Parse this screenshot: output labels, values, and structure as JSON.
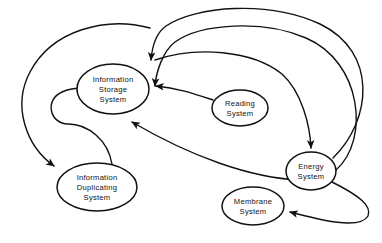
{
  "diagram": {
    "background_color": "#ffffff",
    "stroke_color": "#111111",
    "width": 382,
    "height": 243,
    "nodes": [
      {
        "id": "information-storage-system",
        "label_lines": [
          "Information",
          "Storage",
          "System"
        ],
        "line1": "Information",
        "line2": "Storage",
        "line3": "System",
        "cx": 113,
        "cy": 89,
        "rx": 36,
        "ry": 25
      },
      {
        "id": "reading-system",
        "label_lines": [
          "Reading",
          "System"
        ],
        "line1": "Reading",
        "line2": "System",
        "cx": 240,
        "cy": 108,
        "rx": 28,
        "ry": 18
      },
      {
        "id": "energy-system",
        "label_lines": [
          "Energy",
          "System"
        ],
        "line1": "Energy",
        "line2": "System",
        "cx": 311,
        "cy": 171,
        "rx": 25,
        "ry": 19
      },
      {
        "id": "membrane-system",
        "label_lines": [
          "Membrane",
          "System"
        ],
        "line1": "Membrane",
        "line2": "System",
        "cx": 253,
        "cy": 206,
        "rx": 31,
        "ry": 19
      },
      {
        "id": "information-duplicating-system",
        "label_lines": [
          "Information",
          "Duplicating",
          "System"
        ],
        "line1": "Information",
        "line2": "Duplicating",
        "line3": "System",
        "cx": 97,
        "cy": 187,
        "rx": 40,
        "ry": 24
      }
    ],
    "edges": [
      {
        "id": "edge-energy-to-storage-upper",
        "from": "energy-system",
        "to": "information-storage-system"
      },
      {
        "id": "edge-energy-to-storage-lower",
        "from": "energy-system",
        "to": "information-storage-system"
      },
      {
        "id": "edge-reading-to-storage",
        "from": "reading-system",
        "to": "information-storage-system"
      },
      {
        "id": "edge-storage-to-energy",
        "from": "information-storage-system",
        "to": "energy-system"
      },
      {
        "id": "edge-storage-to-duplicating",
        "from": "information-storage-system",
        "to": "information-duplicating-system"
      },
      {
        "id": "edge-duplicating-to-storage",
        "from": "information-duplicating-system",
        "to": "information-storage-system"
      },
      {
        "id": "edge-duplicating-loop-to-storage",
        "from": "information-duplicating-system",
        "to": "information-storage-system"
      },
      {
        "id": "edge-energy-to-membrane",
        "from": "energy-system",
        "to": "membrane-system"
      }
    ]
  }
}
